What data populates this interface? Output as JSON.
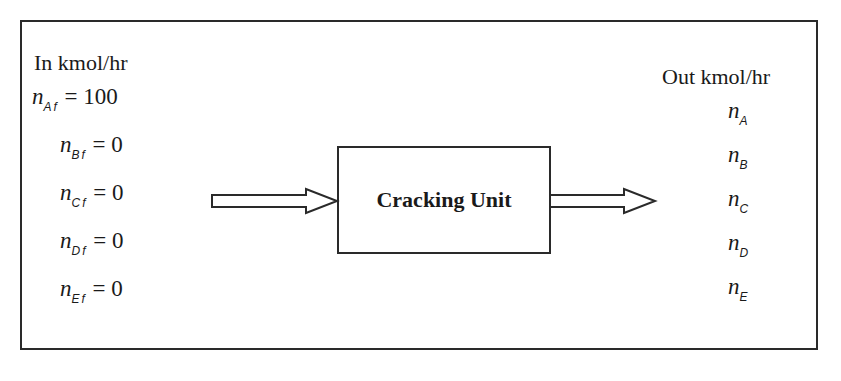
{
  "diagram": {
    "inputs": {
      "heading": "In kmol/hr",
      "streams": [
        {
          "symbol": "n",
          "subscript": "Af",
          "equals": "= 100"
        },
        {
          "symbol": "n",
          "subscript": "Bf",
          "equals": "= 0"
        },
        {
          "symbol": "n",
          "subscript": "Cf",
          "equals": "= 0"
        },
        {
          "symbol": "n",
          "subscript": "Df",
          "equals": "= 0"
        },
        {
          "symbol": "n",
          "subscript": "Ef",
          "equals": "= 0"
        }
      ]
    },
    "process_unit": {
      "label": "Cracking Unit"
    },
    "outputs": {
      "heading": "Out kmol/hr",
      "streams": [
        {
          "symbol": "n",
          "subscript": "A"
        },
        {
          "symbol": "n",
          "subscript": "B"
        },
        {
          "symbol": "n",
          "subscript": "C"
        },
        {
          "symbol": "n",
          "subscript": "D"
        },
        {
          "symbol": "n",
          "subscript": "E"
        }
      ]
    },
    "colors": {
      "line": "#2a2a2a",
      "background": "#ffffff"
    }
  }
}
